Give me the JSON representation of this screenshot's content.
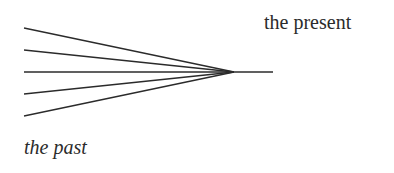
{
  "labels": {
    "present": "the present",
    "past": "the past"
  },
  "diagram": {
    "stroke_color": "#2b2b2b",
    "convergence_point": [
      234,
      72
    ],
    "tail_end": [
      273,
      72
    ],
    "line_starts": [
      [
        24,
        28
      ],
      [
        24,
        50
      ],
      [
        24,
        72
      ],
      [
        24,
        94
      ],
      [
        24,
        116
      ]
    ]
  }
}
